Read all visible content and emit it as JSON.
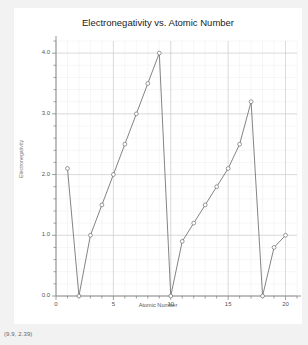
{
  "status_readout": "(9.9, 2.39)",
  "chart_data": {
    "type": "line",
    "title": "Electronegativity vs. Atomic Number",
    "xlabel": "Atomic Number",
    "ylabel": "Electronegativity",
    "xlim": [
      0,
      21
    ],
    "ylim": [
      0,
      4.2
    ],
    "xticks": [
      0,
      5,
      10,
      15,
      20
    ],
    "xtick_labels": [
      "0",
      "5",
      "10",
      "15",
      "20"
    ],
    "yticks": [
      0.0,
      1.0,
      2.0,
      3.0,
      4.0
    ],
    "ytick_labels": [
      "0.0",
      "1.0",
      "2.0",
      "3.0",
      "4.0"
    ],
    "x_minor_step": 1,
    "y_minor_step": 0.2,
    "grid": true,
    "legend": "none",
    "marker": "open-circle",
    "line_color": "#6e6e6e",
    "marker_color": "#6e6e6e",
    "grid_color": "#ededf2",
    "major_grid_color": "#c9c9c9",
    "axis_color": "#888888",
    "x": [
      1,
      2,
      3,
      4,
      5,
      6,
      7,
      8,
      9,
      10,
      11,
      12,
      13,
      14,
      15,
      16,
      17,
      18,
      19,
      20
    ],
    "values": [
      2.1,
      0.0,
      1.0,
      1.5,
      2.0,
      2.5,
      3.0,
      3.5,
      4.0,
      0.0,
      0.9,
      1.2,
      1.5,
      1.8,
      2.1,
      2.5,
      3.2,
      0.0,
      0.8,
      1.0
    ]
  }
}
